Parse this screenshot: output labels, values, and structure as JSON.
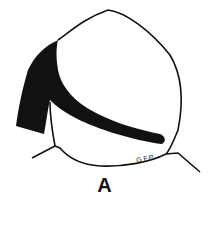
{
  "figure": {
    "label": "A",
    "signature": "G.F.P.",
    "colors": {
      "stroke": "#111111",
      "fill": "#111111",
      "background": "#ffffff"
    }
  }
}
